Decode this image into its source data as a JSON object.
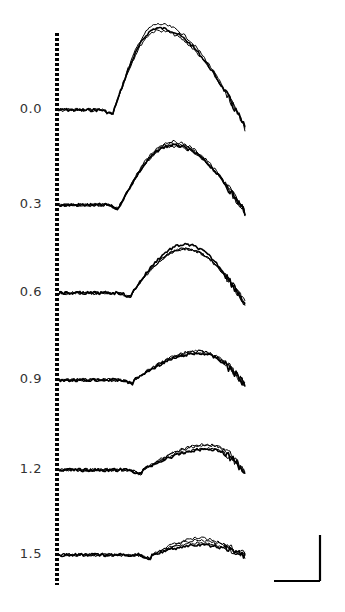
{
  "chart_data": {
    "type": "line",
    "title": "",
    "xlabel": "",
    "ylabel": "",
    "grid": false,
    "legend": null,
    "row_labels": [
      "0.0",
      "0.3",
      "0.6",
      "0.9",
      "1.2",
      "1.5"
    ],
    "series": [
      {
        "name": "0.0",
        "baseline_y": 110,
        "dip_x": 114,
        "peak_x": 158,
        "peak_height": 82,
        "end_drop": 30,
        "trials": 3
      },
      {
        "name": "0.3",
        "baseline_y": 205,
        "dip_x": 120,
        "peak_x": 172,
        "peak_height": 60,
        "end_drop": 12,
        "trials": 4
      },
      {
        "name": "0.6",
        "baseline_y": 293,
        "dip_x": 132,
        "peak_x": 185,
        "peak_height": 46,
        "end_drop": 18,
        "trials": 4
      },
      {
        "name": "0.9",
        "baseline_y": 380,
        "dip_x": 134,
        "peak_x": 200,
        "peak_height": 28,
        "end_drop": 8,
        "trials": 4
      },
      {
        "name": "1.2",
        "baseline_y": 470,
        "dip_x": 142,
        "peak_x": 210,
        "peak_height": 20,
        "end_drop": 3,
        "trials": 4
      },
      {
        "name": "1.5",
        "baseline_y": 555,
        "dip_x": 152,
        "peak_x": 200,
        "peak_height": 10,
        "end_drop": 0,
        "trials": 4
      }
    ],
    "onset_marker": {
      "style": "dotted",
      "x": 57,
      "y_top": 33,
      "y_bottom": 585
    },
    "scale_bar": {
      "horizontal_len_px": 46,
      "vertical_len_px": 46,
      "labels": []
    },
    "trace_x_start": 59,
    "trace_x_end": 245
  }
}
